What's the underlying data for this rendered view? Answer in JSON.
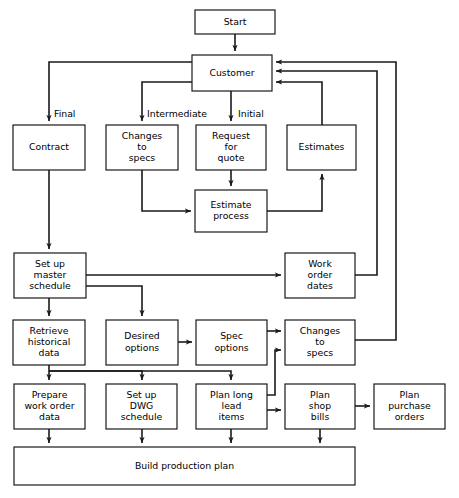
{
  "diagram": {
    "type": "flowchart",
    "background_color": "#ffffff",
    "line_color": "#1a1a1a",
    "text_color": "#000000"
  },
  "nodes": [
    {
      "id": "start",
      "label": "Start",
      "lines": [
        "Start"
      ],
      "x": 195,
      "y": 10,
      "w": 80,
      "h": 24
    },
    {
      "id": "customer",
      "label": "Customer",
      "lines": [
        "Customer"
      ],
      "x": 192,
      "y": 55,
      "w": 80,
      "h": 36
    },
    {
      "id": "contract",
      "label": "Contract",
      "lines": [
        "Contract"
      ],
      "x": 13,
      "y": 125,
      "w": 72,
      "h": 45
    },
    {
      "id": "changes_specs_top",
      "label": "Changes to specs",
      "lines": [
        "Changes",
        "to",
        "specs"
      ],
      "x": 106,
      "y": 125,
      "w": 72,
      "h": 45
    },
    {
      "id": "request_quote",
      "label": "Request for quote",
      "lines": [
        "Request",
        "for",
        "quote"
      ],
      "x": 196,
      "y": 125,
      "w": 70,
      "h": 45
    },
    {
      "id": "estimates",
      "label": "Estimates",
      "lines": [
        "Estimates"
      ],
      "x": 287,
      "y": 125,
      "w": 69,
      "h": 45
    },
    {
      "id": "estimate_process",
      "label": "Estimate process",
      "lines": [
        "Estimate",
        "process"
      ],
      "x": 195,
      "y": 190,
      "w": 72,
      "h": 42
    },
    {
      "id": "master_schedule",
      "label": "Set up master schedule",
      "lines": [
        "Set up",
        "master",
        "schedule"
      ],
      "x": 14,
      "y": 253,
      "w": 72,
      "h": 45
    },
    {
      "id": "work_order_dates",
      "label": "Work order dates",
      "lines": [
        "Work",
        "order",
        "dates"
      ],
      "x": 285,
      "y": 253,
      "w": 70,
      "h": 45
    },
    {
      "id": "retrieve_hist",
      "label": "Retrieve historical data",
      "lines": [
        "Retrieve",
        "historical",
        "data"
      ],
      "x": 13,
      "y": 320,
      "w": 72,
      "h": 45
    },
    {
      "id": "desired_options",
      "label": "Desired options",
      "lines": [
        "Desired",
        "options"
      ],
      "x": 106,
      "y": 320,
      "w": 72,
      "h": 45
    },
    {
      "id": "spec_options",
      "label": "Spec options",
      "lines": [
        "Spec",
        "options"
      ],
      "x": 196,
      "y": 320,
      "w": 71,
      "h": 45
    },
    {
      "id": "changes_specs_bot",
      "label": "Changes to specs",
      "lines": [
        "Changes",
        "to",
        "specs"
      ],
      "x": 285,
      "y": 320,
      "w": 70,
      "h": 45
    },
    {
      "id": "prepare_wo",
      "label": "Prepare work order data",
      "lines": [
        "Prepare",
        "work order",
        "data"
      ],
      "x": 14,
      "y": 384,
      "w": 71,
      "h": 45
    },
    {
      "id": "dwg_schedule",
      "label": "Set up DWG schedule",
      "lines": [
        "Set up",
        "DWG",
        "schedule"
      ],
      "x": 106,
      "y": 384,
      "w": 71,
      "h": 45
    },
    {
      "id": "plan_long_lead",
      "label": "Plan long lead items",
      "lines": [
        "Plan long",
        "lead",
        "items"
      ],
      "x": 196,
      "y": 384,
      "w": 71,
      "h": 45
    },
    {
      "id": "plan_shop_bills",
      "label": "Plan shop bills",
      "lines": [
        "Plan",
        "shop",
        "bills"
      ],
      "x": 285,
      "y": 384,
      "w": 70,
      "h": 45
    },
    {
      "id": "plan_purchase",
      "label": "Plan purchase orders",
      "lines": [
        "Plan",
        "purchase",
        "orders"
      ],
      "x": 374,
      "y": 384,
      "w": 71,
      "h": 45
    },
    {
      "id": "build_plan",
      "label": "Build production plan",
      "lines": [
        "Build production plan"
      ],
      "x": 14,
      "y": 447,
      "w": 341,
      "h": 38
    }
  ],
  "edge_labels": [
    {
      "id": "final",
      "text": "Final",
      "x": 54,
      "y": 114
    },
    {
      "id": "intermediate",
      "text": "Intermediate",
      "x": 147,
      "y": 114
    },
    {
      "id": "initial",
      "text": "Initial",
      "x": 238,
      "y": 114
    }
  ],
  "edges": [
    {
      "id": "start-to-customer",
      "from": "start",
      "to": "customer",
      "d": "M 235 34 L 235 51",
      "arrow": "end"
    },
    {
      "id": "customer-to-contract",
      "from": "customer",
      "to": "contract",
      "d": "M 192 62 L 49 62 L 49 121",
      "arrow": "end"
    },
    {
      "id": "customer-to-changes-specs",
      "from": "customer",
      "to": "changes_specs_top",
      "d": "M 192 82 L 142 82 L 142 121",
      "arrow": "end"
    },
    {
      "id": "customer-to-request-quote",
      "from": "customer",
      "to": "request_quote",
      "d": "M 231 91 L 231 121",
      "arrow": "end"
    },
    {
      "id": "request-quote-to-estimate",
      "from": "request_quote",
      "to": "estimate_process",
      "d": "M 231 170 L 231 186",
      "arrow": "end"
    },
    {
      "id": "changes-specs-to-estimate",
      "from": "changes_specs_top",
      "to": "estimate_process",
      "d": "M 142 170 L 142 211 L 191 211",
      "arrow": "end"
    },
    {
      "id": "estimate-to-estimates",
      "from": "estimate_process",
      "to": "estimates",
      "d": "M 267 211 L 322 211 L 322 174",
      "arrow": "end"
    },
    {
      "id": "estimates-to-customer",
      "from": "estimates",
      "to": "customer",
      "d": "M 322 125 L 322 82 L 276 82",
      "arrow": "end"
    },
    {
      "id": "contract-to-master-schedule",
      "from": "contract",
      "to": "master_schedule",
      "d": "M 49 170 L 49 249",
      "arrow": "end"
    },
    {
      "id": "master-to-work-order-dates",
      "from": "master_schedule",
      "to": "work_order_dates",
      "d": "M 86 275 L 281 275",
      "arrow": "end"
    },
    {
      "id": "master-to-desired-options",
      "from": "master_schedule",
      "to": "desired_options",
      "d": "M 86 286 L 142 286 L 142 316",
      "arrow": "end"
    },
    {
      "id": "master-to-retrieve-hist",
      "from": "master_schedule",
      "to": "retrieve_hist",
      "d": "M 49 298 L 49 316",
      "arrow": "end"
    },
    {
      "id": "work-order-dates-to-customer",
      "from": "work_order_dates",
      "to": "customer",
      "d": "M 355 275 L 377 275 L 377 71 L 276 71",
      "arrow": "end"
    },
    {
      "id": "desired-to-spec-options",
      "from": "desired_options",
      "to": "spec_options",
      "d": "M 178 342 L 192 342",
      "arrow": "end"
    },
    {
      "id": "spec-options-to-changes",
      "from": "spec_options",
      "to": "changes_specs_bot",
      "d": "M 267 331 L 281 331",
      "arrow": "end"
    },
    {
      "id": "plan-long-lead-to-changes",
      "from": "plan_long_lead",
      "to": "changes_specs_bot",
      "d": "M 267 395 L 275 395 L 275 350 L 281 350",
      "arrow": "end"
    },
    {
      "id": "changes-bot-to-customer",
      "from": "changes_specs_bot",
      "to": "customer",
      "d": "M 355 340 L 396 340 L 396 62 L 276 62",
      "arrow": "end"
    },
    {
      "id": "retrieve-to-prepare-wo",
      "from": "retrieve_hist",
      "to": "prepare_wo",
      "d": "M 49 365 L 49 380",
      "arrow": "end"
    },
    {
      "id": "retrieve-to-dwg",
      "from": "retrieve_hist",
      "to": "dwg_schedule",
      "d": "M 49 371 L 142 371 L 142 380",
      "arrow": "end"
    },
    {
      "id": "retrieve-to-plan-long-lead",
      "from": "retrieve_hist",
      "to": "plan_long_lead",
      "d": "M 49 371 L 231 371 L 231 380",
      "arrow": "end"
    },
    {
      "id": "plan-long-lead-to-shop-bills",
      "from": "plan_long_lead",
      "to": "plan_shop_bills",
      "d": "M 267 410 L 281 410",
      "arrow": "end"
    },
    {
      "id": "shop-bills-to-purchase",
      "from": "plan_shop_bills",
      "to": "plan_purchase",
      "d": "M 355 406 L 370 406",
      "arrow": "end"
    },
    {
      "id": "prepare-wo-to-build",
      "from": "prepare_wo",
      "to": "build_plan",
      "d": "M 49 429 L 49 443",
      "arrow": "end"
    },
    {
      "id": "dwg-to-build",
      "from": "dwg_schedule",
      "to": "build_plan",
      "d": "M 142 429 L 142 443",
      "arrow": "end"
    },
    {
      "id": "plan-long-lead-to-build",
      "from": "plan_long_lead",
      "to": "build_plan",
      "d": "M 231 429 L 231 443",
      "arrow": "end"
    },
    {
      "id": "shop-bills-to-build",
      "from": "plan_shop_bills",
      "to": "build_plan",
      "d": "M 320 429 L 320 443",
      "arrow": "end"
    }
  ]
}
